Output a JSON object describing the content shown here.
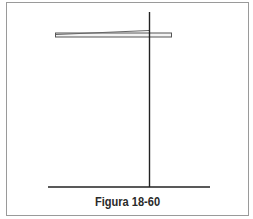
{
  "figure": {
    "caption": "Figura 18-60",
    "colors": {
      "line": "#222222",
      "bar_fill": "#f4f4f4",
      "bar_stroke": "#555555",
      "frame": "#9a9a9a"
    },
    "elements": {
      "vertical_line": {
        "x": 149,
        "y1": 12,
        "y2": 187
      },
      "base_line": {
        "x1": 48,
        "x2": 210,
        "y": 187
      },
      "bar": {
        "x1": 55,
        "x2": 171,
        "y_top": 33,
        "y_bottom": 37
      },
      "tilted_edge": {
        "x1": 56,
        "y1": 34.5,
        "x2": 149,
        "y2": 30.5
      }
    }
  }
}
